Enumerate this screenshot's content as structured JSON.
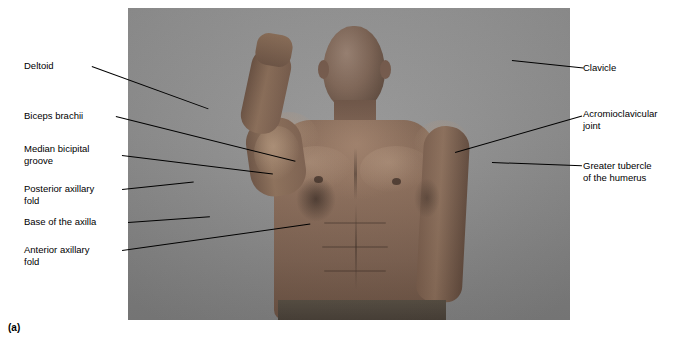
{
  "figure": {
    "letter": "(a)",
    "photo_alt": "grayscale photograph of a man with right arm flexed showing surface anatomy of shoulder and axilla"
  },
  "labels_left": [
    {
      "id": "deltoid",
      "text": "Deltoid"
    },
    {
      "id": "biceps-brachii",
      "text": "Biceps brachii"
    },
    {
      "id": "median-bicipital-groove",
      "text": "Median bicipital\ngroove"
    },
    {
      "id": "posterior-axillary-fold",
      "text": "Posterior axillary\nfold"
    },
    {
      "id": "base-of-the-axilla",
      "text": "Base of the axilla"
    },
    {
      "id": "anterior-axillary-fold",
      "text": "Anterior axillary\nfold"
    }
  ],
  "labels_right": [
    {
      "id": "clavicle",
      "text": "Clavicle"
    },
    {
      "id": "acromioclavicular-joint",
      "text": "Acromioclavicular\njoint"
    },
    {
      "id": "greater-tubercle-of-the-humerus",
      "text": "Greater tubercle\nof the humerus"
    }
  ],
  "colors": {
    "photo_background": "#8f8f8f",
    "leader_line": "#000000",
    "text": "#000000",
    "page_background": "#ffffff"
  }
}
